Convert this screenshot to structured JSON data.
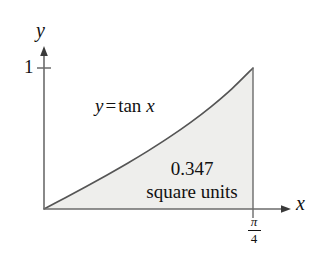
{
  "figure": {
    "background_color": "#ffffff",
    "stroke_color": "#555555",
    "axis_color": "#6b6b6b",
    "fill_color": "#eeeeec",
    "text_color": "#111111"
  },
  "axes": {
    "y_axis_label": "y",
    "x_axis_label": "x",
    "y_tick_label": "1",
    "x_bound_numerator": "π",
    "x_bound_denominator": "4"
  },
  "annotations": {
    "curve_equation_y": "y",
    "curve_equation_equals": "=",
    "curve_equation_function": "tan",
    "curve_equation_variable": "x",
    "area_value": "0.347",
    "area_units": "square units"
  },
  "chart_data": {
    "type": "area",
    "title": "",
    "xlabel": "x",
    "ylabel": "y",
    "function": "y = tan x",
    "xlim": [
      0,
      0.7853981634
    ],
    "ylim": [
      0,
      1
    ],
    "xtick_values": [
      0.7853981634
    ],
    "xtick_labels": [
      "π/4"
    ],
    "ytick_values": [
      1
    ],
    "ytick_labels": [
      "1"
    ],
    "grid": false,
    "legend": "none",
    "shaded_region": {
      "label": "0.347 square units",
      "value": 0.347,
      "from": 0,
      "to": 0.7853981634
    },
    "x": [
      0,
      0.0785,
      0.1571,
      0.2356,
      0.3142,
      0.3927,
      0.4712,
      0.5498,
      0.6283,
      0.7069,
      0.7854
    ],
    "values": [
      0,
      0.0787,
      0.1584,
      0.2401,
      0.3249,
      0.4142,
      0.5095,
      0.6128,
      0.7265,
      0.8541,
      1.0
    ]
  }
}
